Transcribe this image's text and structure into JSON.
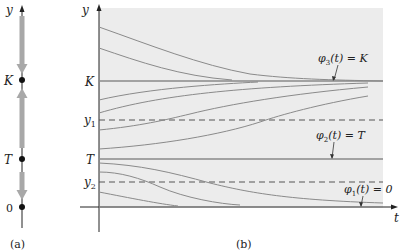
{
  "panel_a": {
    "caption": "(a)",
    "axis_label": "y",
    "points": [
      {
        "label": "K",
        "y": 80
      },
      {
        "label": "T",
        "y": 159
      },
      {
        "label": "0",
        "y": 207
      }
    ],
    "arrows": [
      {
        "from": 18,
        "to": 70,
        "direction": "down"
      },
      {
        "from": 150,
        "to": 92,
        "direction": "up"
      },
      {
        "from": 170,
        "to": 198,
        "direction": "down"
      }
    ]
  },
  "panel_b": {
    "caption": "(b)",
    "y_axis_label": "y",
    "x_axis_label": "t",
    "levels": {
      "K": {
        "label": "K",
        "y": 81,
        "style": "solid"
      },
      "y1": {
        "label": "y",
        "sub": "1",
        "y": 120,
        "style": "dashed"
      },
      "T": {
        "label": "T",
        "y": 159,
        "style": "solid"
      },
      "y2": {
        "label": "y",
        "sub": "2",
        "y": 182,
        "style": "dashed"
      },
      "zero": {
        "y": 207,
        "style": "solid"
      }
    },
    "annotations": [
      {
        "phi": "φ",
        "sub": "3",
        "text": "(t) = K"
      },
      {
        "phi": "φ",
        "sub": "2",
        "text": "(t) = T"
      },
      {
        "phi": "φ",
        "sub": "1",
        "text": "(t) = 0"
      }
    ]
  },
  "colors": {
    "background_shade": "#ececec",
    "curve": "#8a8a8a",
    "arrow": "#a8a8a8",
    "axis": "#222222"
  }
}
